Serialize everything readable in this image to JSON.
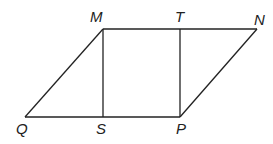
{
  "diagram": {
    "type": "geometry-figure",
    "points": {
      "M": {
        "label": "M",
        "x": 103,
        "y": 29
      },
      "T": {
        "label": "T",
        "x": 180,
        "y": 29
      },
      "N": {
        "label": "N",
        "x": 257,
        "y": 29
      },
      "Q": {
        "label": "Q",
        "x": 25,
        "y": 117
      },
      "S": {
        "label": "S",
        "x": 103,
        "y": 117
      },
      "P": {
        "label": "P",
        "x": 180,
        "y": 117
      }
    },
    "segments": [
      [
        "M",
        "N"
      ],
      [
        "Q",
        "P"
      ],
      [
        "Q",
        "M"
      ],
      [
        "P",
        "N"
      ],
      [
        "M",
        "S"
      ],
      [
        "T",
        "P"
      ]
    ],
    "line_color": "#222222"
  }
}
